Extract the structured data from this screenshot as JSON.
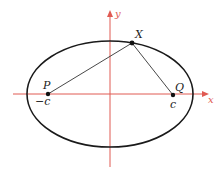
{
  "diagram": {
    "axes": {
      "x_label": "x",
      "y_label": "y",
      "color": "#e05a52"
    },
    "ellipse": {
      "cx": 110,
      "cy": 94,
      "rx": 83,
      "ry": 53,
      "stroke": "#1a1a1a"
    },
    "points": [
      {
        "id": "P",
        "label": "P",
        "coord_label": "−c",
        "x": 48,
        "y": 94
      },
      {
        "id": "Q",
        "label": "Q",
        "coord_label": "c",
        "x": 173,
        "y": 95
      },
      {
        "id": "X",
        "label": "X",
        "x": 132,
        "y": 43
      }
    ],
    "segments": [
      {
        "from": "P",
        "to": "X"
      },
      {
        "from": "X",
        "to": "Q"
      }
    ]
  }
}
